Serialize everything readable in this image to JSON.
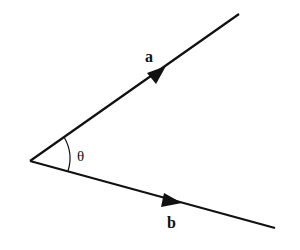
{
  "diagram": {
    "title": "",
    "vectors": [
      {
        "name": "a",
        "label": "a",
        "from": [
          30,
          161
        ],
        "to": [
          239,
          14
        ]
      },
      {
        "name": "b",
        "label": "b",
        "from": [
          30,
          161
        ],
        "to": [
          275,
          228
        ]
      }
    ],
    "angle": {
      "label": "θ",
      "between": [
        "a",
        "b"
      ]
    },
    "colors": {
      "stroke": "#111111",
      "background": "#ffffff"
    }
  }
}
